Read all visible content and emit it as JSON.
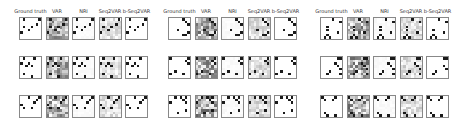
{
  "figure": {
    "column_headers": [
      "Ground truth",
      "VAR",
      "NRI",
      "Seq2VAR",
      "b-Seq2VAR"
    ],
    "groups": [
      {
        "name": "group-1",
        "x": 19,
        "rows": 3
      },
      {
        "name": "group-2",
        "x": 168,
        "rows": 3
      },
      {
        "name": "group-3",
        "x": 320,
        "rows": 3
      }
    ],
    "layout": {
      "panel_size": 23,
      "column_pitch": 26.5,
      "row_tops": [
        17,
        56,
        95
      ]
    },
    "methods": {
      "Ground truth": {
        "background": "white",
        "noise": 0
      },
      "VAR": {
        "background": "gray-noise",
        "noise": 0.55
      },
      "NRI": {
        "background": "white",
        "noise": 0.03
      },
      "Seq2VAR": {
        "background": "light-gray-noise",
        "noise": 0.22
      },
      "b-Seq2VAR": {
        "background": "white",
        "noise": 0
      }
    }
  }
}
